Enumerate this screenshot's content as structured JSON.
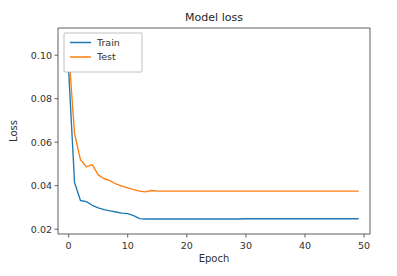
{
  "figure": {
    "title": "Model loss",
    "background_color": "#ffffff"
  },
  "axes": {
    "xlabel": "Epoch",
    "ylabel": "Loss",
    "xticks": [
      "0",
      "10",
      "20",
      "30",
      "40",
      "50"
    ],
    "yticks": [
      "0.02",
      "0.04",
      "0.06",
      "0.08",
      "0.10"
    ],
    "xlim": [
      -1.8,
      51.0
    ],
    "ylim": [
      0.0178,
      0.1125
    ],
    "spine_color": "#4d4d4d",
    "grid": false
  },
  "legend": {
    "location": "upper left",
    "frame": true,
    "entries": [
      {
        "label": "Train",
        "color": "#1f77b4"
      },
      {
        "label": "Test",
        "color": "#ff7f0e"
      }
    ]
  },
  "chart_data": {
    "type": "line",
    "title": "Model loss",
    "xlabel": "Epoch",
    "ylabel": "Loss",
    "xlim": [
      -1.8,
      51.0
    ],
    "ylim": [
      0.0178,
      0.1125
    ],
    "grid": false,
    "legend_position": "upper left",
    "x": [
      0,
      1,
      2,
      3,
      4,
      5,
      6,
      7,
      8,
      9,
      10,
      11,
      12,
      13,
      14,
      15,
      16,
      17,
      18,
      19,
      20,
      21,
      22,
      23,
      24,
      25,
      26,
      27,
      28,
      29,
      30,
      31,
      32,
      33,
      34,
      35,
      36,
      37,
      38,
      39,
      40,
      41,
      42,
      43,
      44,
      45,
      46,
      47,
      48,
      49
    ],
    "series": [
      {
        "name": "Train",
        "color": "#1f77b4",
        "values": [
          0.093,
          0.0415,
          0.0332,
          0.0327,
          0.031,
          0.0298,
          0.029,
          0.0284,
          0.0279,
          0.0274,
          0.0272,
          0.0262,
          0.0249,
          0.0247,
          0.0247,
          0.0247,
          0.0247,
          0.0247,
          0.0247,
          0.0247,
          0.0247,
          0.0247,
          0.0247,
          0.0247,
          0.0247,
          0.0247,
          0.0247,
          0.0247,
          0.0247,
          0.0247,
          0.0248,
          0.0248,
          0.0248,
          0.0248,
          0.0248,
          0.0248,
          0.0248,
          0.0248,
          0.0248,
          0.0248,
          0.0248,
          0.0248,
          0.0248,
          0.0248,
          0.0248,
          0.0248,
          0.0248,
          0.0248,
          0.0248,
          0.0248
        ]
      },
      {
        "name": "Test",
        "color": "#ff7f0e",
        "values": [
          0.102,
          0.064,
          0.052,
          0.0487,
          0.0497,
          0.045,
          0.0432,
          0.0423,
          0.0408,
          0.0398,
          0.039,
          0.0382,
          0.0375,
          0.0372,
          0.0378,
          0.0375,
          0.0375,
          0.0375,
          0.0375,
          0.0375,
          0.0375,
          0.0375,
          0.0375,
          0.0375,
          0.0375,
          0.0375,
          0.0375,
          0.0375,
          0.0375,
          0.0375,
          0.0375,
          0.0375,
          0.0375,
          0.0375,
          0.0375,
          0.0375,
          0.0375,
          0.0375,
          0.0375,
          0.0375,
          0.0375,
          0.0375,
          0.0375,
          0.0375,
          0.0375,
          0.0375,
          0.0375,
          0.0375,
          0.0375,
          0.0375
        ]
      }
    ]
  }
}
